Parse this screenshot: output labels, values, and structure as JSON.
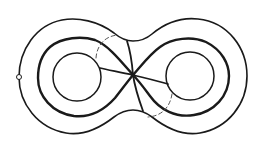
{
  "figure": {
    "colors": {
      "stroke": "#1a1a1a",
      "dashed": "#555555",
      "background": "#ffffff"
    },
    "outer_contour": {
      "left_lobe": {
        "cx": 76,
        "cy": 75,
        "r": 57
      },
      "right_lobe": {
        "cx": 191,
        "cy": 75,
        "r": 57
      },
      "waist_top_y": 40,
      "waist_bottom_y": 111
    },
    "inner_holes": [
      {
        "name": "left-hole",
        "cx": 77,
        "cy": 77,
        "r": 24
      },
      {
        "name": "right-hole",
        "cx": 190,
        "cy": 76,
        "r": 24
      }
    ],
    "center_node": {
      "x": 133,
      "y": 75
    },
    "basepoint_marker": {
      "x": 19,
      "y": 77,
      "r": 2.5
    },
    "dashed_arcs": [
      {
        "name": "upper-left-dashed-arc"
      },
      {
        "name": "lower-right-dashed-arc"
      }
    ]
  }
}
